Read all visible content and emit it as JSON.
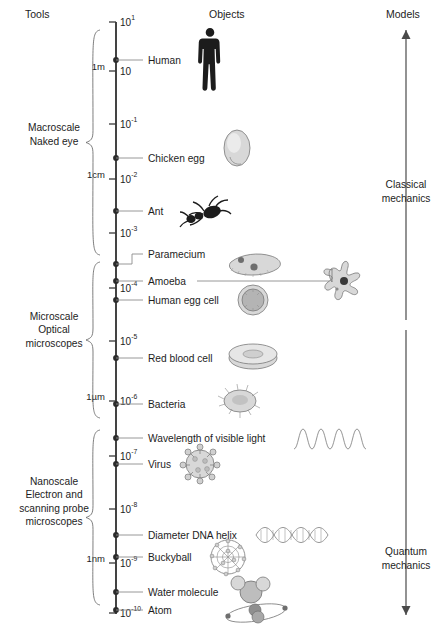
{
  "headers": {
    "tools": "Tools",
    "objects": "Objects",
    "models": "Models"
  },
  "chart_data": {
    "type": "scatter",
    "orientation": "vertical-log-axis",
    "axis": {
      "label": "Size (meters, log scale)",
      "range_exponents": [
        1,
        -10
      ],
      "ticks": [
        {
          "label": "10",
          "exponent": "1",
          "y": 22
        },
        {
          "label": "10",
          "exponent": "",
          "y": 71
        },
        {
          "label": "10",
          "exponent": "-1",
          "y": 124
        },
        {
          "label": "10",
          "exponent": "-2",
          "y": 179
        },
        {
          "label": "10",
          "exponent": "-3",
          "y": 233
        },
        {
          "label": "10",
          "exponent": "-4",
          "y": 288
        },
        {
          "label": "10",
          "exponent": "-5",
          "y": 341
        },
        {
          "label": "10",
          "exponent": "-6",
          "y": 401
        },
        {
          "label": "10",
          "exponent": "-7",
          "y": 456
        },
        {
          "label": "10",
          "exponent": "-8",
          "y": 509
        },
        {
          "label": "10",
          "exponent": "-9",
          "y": 563
        },
        {
          "label": "10",
          "exponent": "-10",
          "y": 613
        }
      ],
      "unit_markers": [
        {
          "label": "1m",
          "y": 66
        },
        {
          "label": "1cm",
          "y": 174
        },
        {
          "label": "1µm",
          "y": 396
        },
        {
          "label": "1nm",
          "y": 558
        }
      ]
    },
    "objects": [
      {
        "label": "Human",
        "y": 60,
        "illustration": "human-silhouette"
      },
      {
        "label": "Chicken egg",
        "y": 158,
        "illustration": "egg"
      },
      {
        "label": "Ant",
        "y": 211,
        "illustration": "ant"
      },
      {
        "label": "Paramecium",
        "y": 264,
        "illustration": "paramecium"
      },
      {
        "label": "Amoeba",
        "y": 281,
        "illustration": "amoeba"
      },
      {
        "label": "Human egg cell",
        "y": 300,
        "illustration": "egg-cell"
      },
      {
        "label": "Red blood cell",
        "y": 358,
        "illustration": "red-blood-cell"
      },
      {
        "label": "Bacteria",
        "y": 404,
        "illustration": "bacteria"
      },
      {
        "label": "Wavelength of visible light",
        "y": 438,
        "illustration": "sine-wave"
      },
      {
        "label": "Virus",
        "y": 464,
        "illustration": "virus"
      },
      {
        "label": "Diameter DNA helix",
        "y": 535,
        "illustration": "dna-helix"
      },
      {
        "label": "Buckyball",
        "y": 557,
        "illustration": "buckyball"
      },
      {
        "label": "Water molecule",
        "y": 592,
        "illustration": "water-molecule"
      },
      {
        "label": "Atom",
        "y": 610,
        "illustration": "atom"
      }
    ],
    "tool_scales": [
      {
        "lines": [
          "Macroscale",
          "Naked eye"
        ],
        "brace_top": 30,
        "brace_bottom": 255,
        "label_y": 138
      },
      {
        "lines": [
          "Microscale",
          "Optical",
          "microscopes"
        ],
        "brace_top": 262,
        "brace_bottom": 418,
        "label_y": 333
      },
      {
        "lines": [
          "Nanoscale",
          "Electron and",
          "scanning probe",
          "microscopes"
        ],
        "brace_top": 430,
        "brace_bottom": 605,
        "label_y": 505
      }
    ],
    "models": [
      {
        "lines": [
          "Classical",
          "mechanics"
        ],
        "label_y": 195,
        "arrow_direction": "up",
        "arrow_from_y": 320,
        "arrow_to_y": 30
      },
      {
        "lines": [
          "Quantum",
          "mechanics"
        ],
        "label_y": 562,
        "arrow_direction": "down",
        "arrow_from_y": 330,
        "arrow_to_y": 615
      }
    ]
  },
  "colors": {
    "axis": "#3a3a3a",
    "leader": "#8c8c8c",
    "brace": "#6f6f6f",
    "text": "#1d1d1d",
    "illustration_fill": "#d8d8d8",
    "illustration_stroke": "#7a7a7a",
    "dark_silhouette": "#1c1c1c"
  }
}
